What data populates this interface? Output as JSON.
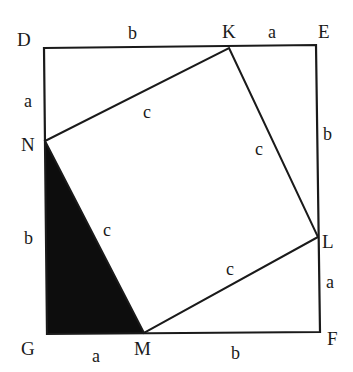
{
  "diagram": {
    "type": "pythagorean-proof-square",
    "outer_square": {
      "vertices": {
        "D": [
          44,
          48
        ],
        "E": [
          316,
          45
        ],
        "F": [
          320,
          332
        ],
        "G": [
          47,
          334
        ]
      },
      "stroke": "#1a1a1a"
    },
    "inner_square": {
      "vertices": {
        "K": [
          229,
          48
        ],
        "L": [
          318,
          237
        ],
        "M": [
          144,
          333
        ],
        "N": [
          45,
          141
        ]
      },
      "stroke": "#1a1a1a"
    },
    "shaded_triangle": {
      "vertices": [
        "N",
        "G",
        "M"
      ],
      "fill": "#0d0d0d"
    },
    "point_labels": [
      {
        "name": "D",
        "text": "D",
        "x": 17,
        "y": 46
      },
      {
        "name": "K",
        "text": "K",
        "x": 222,
        "y": 38
      },
      {
        "name": "E",
        "text": "E",
        "x": 318,
        "y": 38
      },
      {
        "name": "N",
        "text": "N",
        "x": 21,
        "y": 151
      },
      {
        "name": "L",
        "text": "L",
        "x": 322,
        "y": 248
      },
      {
        "name": "G",
        "text": "G",
        "x": 21,
        "y": 355
      },
      {
        "name": "M",
        "text": "M",
        "x": 134,
        "y": 355
      },
      {
        "name": "F",
        "text": "F",
        "x": 327,
        "y": 345
      }
    ],
    "side_labels": [
      {
        "name": "DK",
        "text": "b",
        "x": 128,
        "y": 39
      },
      {
        "name": "KE",
        "text": "a",
        "x": 268,
        "y": 38
      },
      {
        "name": "DN",
        "text": "a",
        "x": 24,
        "y": 107
      },
      {
        "name": "NK",
        "text": "c",
        "x": 143,
        "y": 118
      },
      {
        "name": "EL",
        "text": "b",
        "x": 323,
        "y": 140
      },
      {
        "name": "KL",
        "text": "c",
        "x": 255,
        "y": 155
      },
      {
        "name": "NG",
        "text": "b",
        "x": 24,
        "y": 244
      },
      {
        "name": "NM",
        "text": "c",
        "x": 103,
        "y": 236
      },
      {
        "name": "LM",
        "text": "c",
        "x": 226,
        "y": 275
      },
      {
        "name": "LF",
        "text": "a",
        "x": 326,
        "y": 288
      },
      {
        "name": "GM",
        "text": "a",
        "x": 92,
        "y": 362
      },
      {
        "name": "MF",
        "text": "b",
        "x": 231,
        "y": 359
      }
    ]
  }
}
